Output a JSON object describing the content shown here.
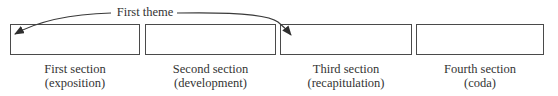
{
  "diagram": {
    "theme_label": "First theme",
    "sections": [
      {
        "title": "First section",
        "subtitle": "(exposition)"
      },
      {
        "title": "Second section",
        "subtitle": "(development)"
      },
      {
        "title": "Third section",
        "subtitle": "(recapitulation)"
      },
      {
        "title": "Fourth section",
        "subtitle": "(coda)"
      }
    ],
    "arrows": [
      {
        "from": "First theme",
        "to": "First section"
      },
      {
        "from": "First theme",
        "to": "Third section"
      }
    ],
    "colors": {
      "line": "#4a4a4a",
      "text": "#333333",
      "background": "#ffffff"
    }
  }
}
